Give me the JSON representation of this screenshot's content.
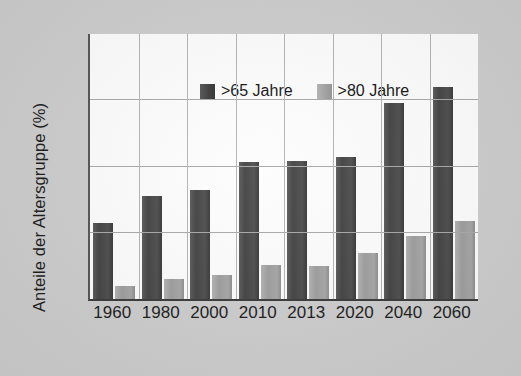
{
  "chart_data": {
    "type": "bar",
    "title": "",
    "subtitle": "",
    "xlabel": "",
    "ylabel": "Anteile der Altersgruppe (%)",
    "categories": [
      "1960",
      "1980",
      "2000",
      "2010",
      "2013",
      "2020",
      "2040",
      "2060"
    ],
    "series": [
      {
        "name": ">65 Jahre",
        "color": "#434343",
        "values": [
          11.5,
          15.5,
          16.4,
          20.7,
          20.8,
          21.5,
          29.9,
          32.0
        ]
      },
      {
        "name": ">80 Jahre",
        "color": "#a0a0a0",
        "values": [
          1.9,
          3.0,
          3.6,
          5.2,
          5.0,
          6.9,
          9.5,
          11.8
        ]
      }
    ],
    "ylim": [
      0,
      40
    ],
    "yticks": [
      0,
      10,
      20,
      30
    ],
    "ytick_labels": [
      "",
      "",
      "",
      ""
    ],
    "grid": "horizontal-and-vertical",
    "grid_color": "#a8a8a8",
    "legend_position": "top-left",
    "plot_background": "#fdfdfd",
    "figure_background": "#cdcdcd"
  },
  "legend": {
    "items": [
      {
        "label": ">65 Jahre",
        "swatch": "dark-gray-swatch"
      },
      {
        "label": ">80 Jahre",
        "swatch": "light-gray-swatch"
      }
    ]
  },
  "axes": {
    "y_axis_title": "Anteile der Altersgruppe (%)",
    "x_tick_labels": [
      "1960",
      "1980",
      "2000",
      "2010",
      "2013",
      "2020",
      "2040",
      "2060"
    ]
  }
}
